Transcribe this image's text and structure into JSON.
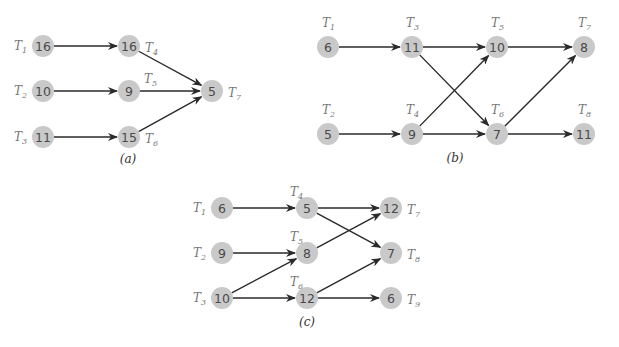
{
  "style": {
    "node_fill": "#c9c9c9",
    "node_text": "#4a4a4a",
    "label_color": "#777777",
    "edge_color": "#2a2a2a",
    "node_radius": 11
  },
  "diagrams": [
    {
      "id": "a",
      "caption": "(a)",
      "caption_pos": [
        128,
        163
      ],
      "nodes": [
        {
          "id": "T1",
          "task": "T",
          "sub": "1",
          "value": "16",
          "x": 43,
          "y": 46,
          "label_pos": "left"
        },
        {
          "id": "T2",
          "task": "T",
          "sub": "2",
          "value": "10",
          "x": 43,
          "y": 91,
          "label_pos": "left"
        },
        {
          "id": "T3",
          "task": "T",
          "sub": "3",
          "value": "11",
          "x": 43,
          "y": 137,
          "label_pos": "left"
        },
        {
          "id": "T4",
          "task": "T",
          "sub": "4",
          "value": "16",
          "x": 129,
          "y": 46,
          "label_pos": "right"
        },
        {
          "id": "T5",
          "task": "T",
          "sub": "5",
          "value": "9",
          "x": 129,
          "y": 91,
          "label_pos": "above-right"
        },
        {
          "id": "T6",
          "task": "T",
          "sub": "6",
          "value": "15",
          "x": 129,
          "y": 137,
          "label_pos": "right"
        },
        {
          "id": "T7",
          "task": "T",
          "sub": "7",
          "value": "5",
          "x": 212,
          "y": 91,
          "label_pos": "right"
        }
      ],
      "edges": [
        [
          "T1",
          "T4"
        ],
        [
          "T2",
          "T5"
        ],
        [
          "T3",
          "T6"
        ],
        [
          "T4",
          "T7"
        ],
        [
          "T5",
          "T7"
        ],
        [
          "T6",
          "T7"
        ]
      ]
    },
    {
      "id": "b",
      "caption": "(b)",
      "caption_pos": [
        455,
        162
      ],
      "nodes": [
        {
          "id": "T1",
          "task": "T",
          "sub": "1",
          "value": "6",
          "x": 328,
          "y": 47,
          "label_pos": "above"
        },
        {
          "id": "T2",
          "task": "T",
          "sub": "2",
          "value": "5",
          "x": 328,
          "y": 134,
          "label_pos": "above"
        },
        {
          "id": "T3",
          "task": "T",
          "sub": "3",
          "value": "11",
          "x": 412,
          "y": 47,
          "label_pos": "above"
        },
        {
          "id": "T4",
          "task": "T",
          "sub": "4",
          "value": "9",
          "x": 412,
          "y": 134,
          "label_pos": "above"
        },
        {
          "id": "T5",
          "task": "T",
          "sub": "5",
          "value": "10",
          "x": 497,
          "y": 47,
          "label_pos": "above"
        },
        {
          "id": "T6",
          "task": "T",
          "sub": "6",
          "value": "7",
          "x": 497,
          "y": 134,
          "label_pos": "above"
        },
        {
          "id": "T7",
          "task": "T",
          "sub": "7",
          "value": "8",
          "x": 584,
          "y": 47,
          "label_pos": "above"
        },
        {
          "id": "T8",
          "task": "T",
          "sub": "8",
          "value": "11",
          "x": 584,
          "y": 134,
          "label_pos": "above"
        }
      ],
      "edges": [
        [
          "T1",
          "T3"
        ],
        [
          "T2",
          "T4"
        ],
        [
          "T3",
          "T5"
        ],
        [
          "T3",
          "T6"
        ],
        [
          "T4",
          "T5"
        ],
        [
          "T4",
          "T6"
        ],
        [
          "T5",
          "T7"
        ],
        [
          "T6",
          "T7"
        ],
        [
          "T6",
          "T8"
        ]
      ]
    },
    {
      "id": "c",
      "caption": "(c)",
      "caption_pos": [
        307,
        326
      ],
      "nodes": [
        {
          "id": "T1",
          "task": "T",
          "sub": "1",
          "value": "6",
          "x": 222,
          "y": 208,
          "label_pos": "left"
        },
        {
          "id": "T2",
          "task": "T",
          "sub": "2",
          "value": "9",
          "x": 222,
          "y": 253,
          "label_pos": "left"
        },
        {
          "id": "T3",
          "task": "T",
          "sub": "3",
          "value": "10",
          "x": 222,
          "y": 298,
          "label_pos": "left"
        },
        {
          "id": "T4",
          "task": "T",
          "sub": "4",
          "value": "5",
          "x": 307,
          "y": 208,
          "label_pos": "above-left"
        },
        {
          "id": "T5",
          "task": "T",
          "sub": "5",
          "value": "8",
          "x": 307,
          "y": 253,
          "label_pos": "above-left"
        },
        {
          "id": "T6",
          "task": "T",
          "sub": "6",
          "value": "12",
          "x": 307,
          "y": 298,
          "label_pos": "above-left"
        },
        {
          "id": "T7",
          "task": "T",
          "sub": "7",
          "value": "12",
          "x": 391,
          "y": 208,
          "label_pos": "right"
        },
        {
          "id": "T8",
          "task": "T",
          "sub": "8",
          "value": "7",
          "x": 391,
          "y": 253,
          "label_pos": "right"
        },
        {
          "id": "T9",
          "task": "T",
          "sub": "9",
          "value": "6",
          "x": 391,
          "y": 298,
          "label_pos": "right"
        }
      ],
      "edges": [
        [
          "T1",
          "T4"
        ],
        [
          "T2",
          "T5"
        ],
        [
          "T3",
          "T5"
        ],
        [
          "T3",
          "T6"
        ],
        [
          "T4",
          "T7"
        ],
        [
          "T4",
          "T8"
        ],
        [
          "T5",
          "T7"
        ],
        [
          "T6",
          "T8"
        ],
        [
          "T6",
          "T9"
        ]
      ]
    }
  ]
}
